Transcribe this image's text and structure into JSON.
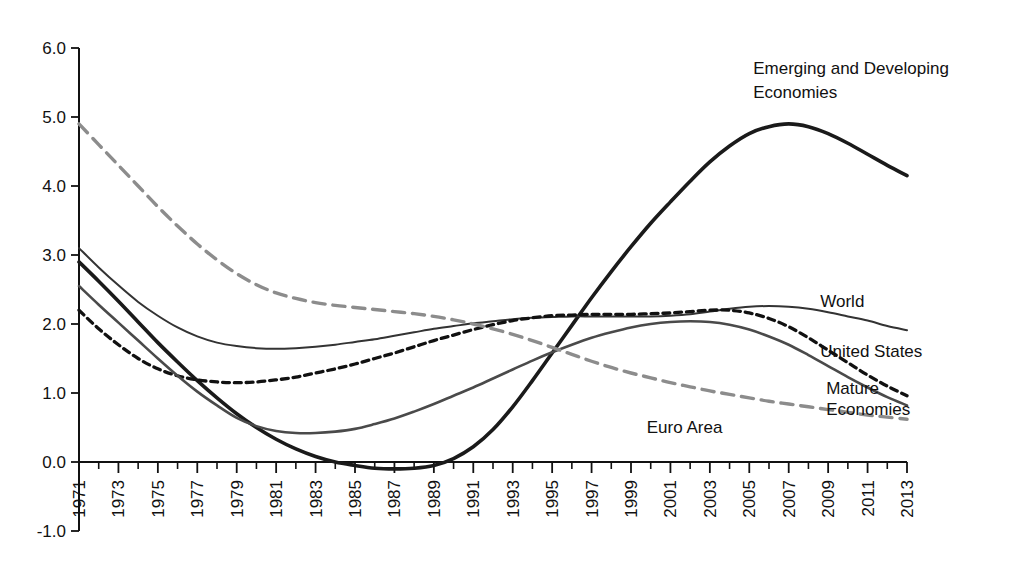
{
  "chart_data": {
    "type": "line",
    "title": "",
    "subtitle": "",
    "xlabel": "",
    "ylabel": "",
    "xlim": [
      1971,
      2013
    ],
    "ylim": [
      -1.0,
      6.0
    ],
    "grid": false,
    "legend_position": "inline-right-of-curve-ends",
    "y_ticks": [
      "6.0",
      "5.0",
      "4.0",
      "3.0",
      "2.0",
      "1.0",
      "0.0",
      "-1.0"
    ],
    "y_tick_values": [
      6.0,
      5.0,
      4.0,
      3.0,
      2.0,
      1.0,
      0.0,
      -1.0
    ],
    "x_ticks": [
      "1971",
      "1973",
      "1975",
      "1977",
      "1979",
      "1981",
      "1983",
      "1985",
      "1987",
      "1989",
      "1991",
      "1993",
      "1995",
      "1997",
      "1999",
      "2001",
      "2003",
      "2005",
      "2007",
      "2009",
      "2011",
      "2013"
    ],
    "x_tick_values": [
      1971,
      1973,
      1975,
      1977,
      1979,
      1981,
      1983,
      1985,
      1987,
      1989,
      1991,
      1993,
      1995,
      1997,
      1999,
      2001,
      2003,
      2005,
      2007,
      2009,
      2011,
      2013
    ],
    "x_minor_every": 1,
    "x": [
      1971,
      1972,
      1973,
      1974,
      1975,
      1976,
      1977,
      1978,
      1979,
      1980,
      1981,
      1982,
      1983,
      1984,
      1985,
      1986,
      1987,
      1988,
      1989,
      1990,
      1991,
      1992,
      1993,
      1994,
      1995,
      1996,
      1997,
      1998,
      1999,
      2000,
      2001,
      2002,
      2003,
      2004,
      2005,
      2006,
      2007,
      2008,
      2009,
      2010,
      2011,
      2012,
      2013
    ],
    "series": [
      {
        "name": "Emerging and Developing Economies",
        "style": "solid",
        "color": "#1a1a1a",
        "width": 3.6,
        "label_x": 2005.2,
        "label_y": 5.62,
        "values": [
          2.9,
          2.62,
          2.33,
          2.03,
          1.73,
          1.45,
          1.18,
          0.93,
          0.7,
          0.5,
          0.33,
          0.19,
          0.08,
          0.0,
          -0.05,
          -0.09,
          -0.1,
          -0.09,
          -0.05,
          0.05,
          0.22,
          0.47,
          0.8,
          1.18,
          1.58,
          1.98,
          2.38,
          2.76,
          3.12,
          3.46,
          3.77,
          4.07,
          4.35,
          4.58,
          4.76,
          4.86,
          4.9,
          4.86,
          4.76,
          4.62,
          4.46,
          4.3,
          4.15
        ]
      },
      {
        "name": "World",
        "style": "solid",
        "color": "#333333",
        "width": 2.0,
        "label_x": 2008.6,
        "label_y": 2.25,
        "values": [
          3.1,
          2.82,
          2.56,
          2.32,
          2.12,
          1.95,
          1.82,
          1.73,
          1.68,
          1.65,
          1.64,
          1.65,
          1.67,
          1.7,
          1.74,
          1.78,
          1.83,
          1.88,
          1.93,
          1.97,
          2.01,
          2.04,
          2.07,
          2.09,
          2.1,
          2.11,
          2.11,
          2.11,
          2.11,
          2.11,
          2.12,
          2.14,
          2.18,
          2.22,
          2.25,
          2.26,
          2.25,
          2.22,
          2.17,
          2.11,
          2.05,
          1.97,
          1.91
        ]
      },
      {
        "name": "United States",
        "style": "dashed-short",
        "color": "#111111",
        "width": 3.3,
        "label_x": 2008.6,
        "label_y": 1.52,
        "values": [
          2.2,
          1.93,
          1.7,
          1.5,
          1.35,
          1.25,
          1.19,
          1.16,
          1.15,
          1.16,
          1.19,
          1.23,
          1.29,
          1.35,
          1.42,
          1.5,
          1.58,
          1.67,
          1.76,
          1.84,
          1.92,
          1.99,
          2.05,
          2.09,
          2.12,
          2.13,
          2.14,
          2.14,
          2.14,
          2.15,
          2.16,
          2.18,
          2.2,
          2.2,
          2.16,
          2.08,
          1.96,
          1.8,
          1.62,
          1.44,
          1.26,
          1.1,
          0.96
        ]
      },
      {
        "name": "Mature Economies",
        "style": "solid",
        "color": "#4a4a4a",
        "width": 2.6,
        "label_x": 2008.6,
        "label_y": 0.93,
        "values": [
          2.55,
          2.28,
          2.02,
          1.76,
          1.5,
          1.25,
          1.02,
          0.82,
          0.64,
          0.52,
          0.45,
          0.42,
          0.42,
          0.44,
          0.48,
          0.55,
          0.63,
          0.73,
          0.84,
          0.96,
          1.08,
          1.21,
          1.34,
          1.47,
          1.59,
          1.7,
          1.8,
          1.88,
          1.95,
          2.0,
          2.03,
          2.04,
          2.03,
          1.99,
          1.92,
          1.82,
          1.7,
          1.55,
          1.39,
          1.23,
          1.08,
          0.94,
          0.82
        ]
      },
      {
        "name": "Euro Area",
        "style": "dashed-long",
        "color": "#8c8c8c",
        "width": 3.4,
        "label_x": 1999.8,
        "label_y": 0.42,
        "values": [
          4.9,
          4.6,
          4.3,
          4.0,
          3.7,
          3.42,
          3.16,
          2.93,
          2.73,
          2.57,
          2.45,
          2.37,
          2.31,
          2.27,
          2.24,
          2.21,
          2.18,
          2.15,
          2.11,
          2.06,
          2.0,
          1.93,
          1.85,
          1.76,
          1.66,
          1.56,
          1.46,
          1.37,
          1.29,
          1.22,
          1.15,
          1.09,
          1.03,
          0.98,
          0.93,
          0.88,
          0.84,
          0.8,
          0.76,
          0.72,
          0.68,
          0.65,
          0.62
        ]
      }
    ],
    "annotations": [
      {
        "text": "Emerging and Developing",
        "x": 2005.2,
        "y": 5.62
      },
      {
        "text": "Economies",
        "x": 2005.2,
        "y": 5.28
      },
      {
        "text": "World",
        "x": 2008.6,
        "y": 2.25
      },
      {
        "text": "United States",
        "x": 2008.6,
        "y": 1.52
      },
      {
        "text": "Mature",
        "x": 2008.9,
        "y": 0.99
      },
      {
        "text": "Economies",
        "x": 2008.9,
        "y": 0.68
      },
      {
        "text": "Euro Area",
        "x": 1999.8,
        "y": 0.42
      }
    ]
  },
  "labels": {
    "emerging_line1": "Emerging and Developing",
    "emerging_line2": "Economies",
    "world": "World",
    "united_states": "United States",
    "mature_line1": "Mature",
    "mature_line2": "Economies",
    "euro_area": "Euro Area"
  }
}
